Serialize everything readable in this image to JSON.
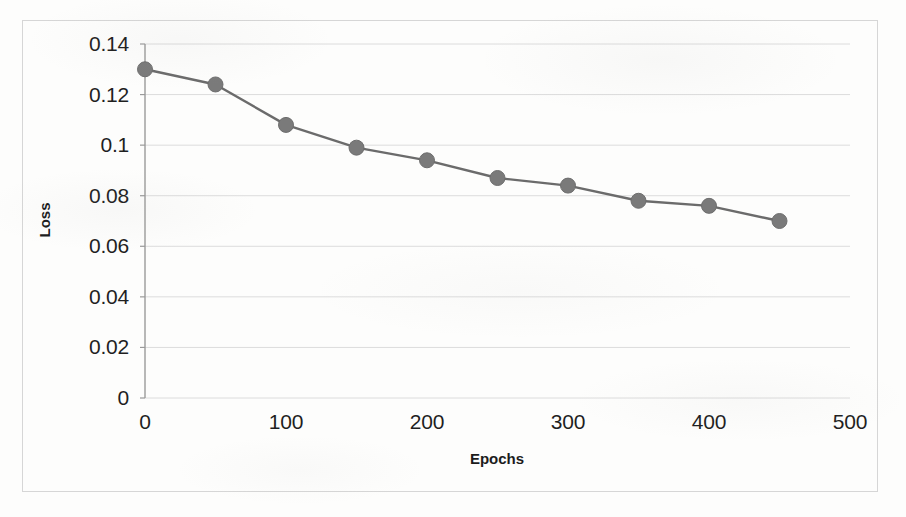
{
  "chart_data": {
    "type": "line",
    "title": "",
    "xlabel": "Epochs",
    "ylabel": "Loss",
    "x": [
      0,
      50,
      100,
      150,
      200,
      250,
      300,
      350,
      400,
      450
    ],
    "values": [
      0.13,
      0.124,
      0.108,
      0.099,
      0.094,
      0.087,
      0.084,
      0.078,
      0.076,
      0.07
    ],
    "series": [
      {
        "name": "Loss",
        "values": [
          0.13,
          0.124,
          0.108,
          0.099,
          0.094,
          0.087,
          0.084,
          0.078,
          0.076,
          0.07
        ]
      }
    ],
    "xlim": [
      0,
      500
    ],
    "ylim": [
      0,
      0.14
    ],
    "x_ticks": [
      "0",
      "100",
      "200",
      "300",
      "400",
      "500"
    ],
    "x_tick_values": [
      0,
      100,
      200,
      300,
      400,
      500
    ],
    "y_ticks": [
      "0",
      "0.02",
      "0.04",
      "0.06",
      "0.08",
      "0.1",
      "0.12",
      "0.14"
    ],
    "y_tick_values": [
      0,
      0.02,
      0.04,
      0.06,
      0.08,
      0.1,
      0.12,
      0.14
    ],
    "grid": "horizontal",
    "legend": "none",
    "marker": "circle",
    "line_color": "#6b6b6b",
    "marker_color": "#7a7a7a",
    "grid_color": "#dcdcdc",
    "axis_color": "#9a9a9a",
    "frame_color": "#d6d6d6",
    "text_color": "#1f1f1f"
  },
  "axes": {
    "y_title": "Loss",
    "x_title": "Epochs"
  }
}
